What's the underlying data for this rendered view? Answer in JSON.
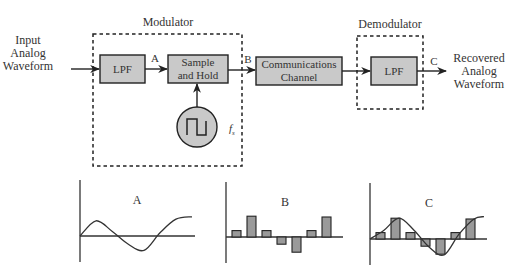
{
  "diagram": {
    "input_label": [
      "Input",
      "Analog",
      "Waveform"
    ],
    "output_label": [
      "Recovered",
      "Analog",
      "Waveform"
    ],
    "modulator": {
      "label": "Modulator",
      "lpf_label": "LPF",
      "sample_hold_label": [
        "Sample",
        "and Hold"
      ],
      "clock_label": "f",
      "clock_subscript": "s"
    },
    "channel_label": [
      "Communications",
      "Channel"
    ],
    "demodulator": {
      "label": "Demodulator",
      "lpf_label": "LPF"
    },
    "points": {
      "a": "A",
      "b": "B",
      "c": "C"
    }
  },
  "waveforms": [
    {
      "id": "A",
      "label": "A",
      "type": "analog",
      "description": "Band-limited analog signal after LPF",
      "samples": [
        0,
        0.95,
        0.3,
        -0.5,
        -0.9,
        0.2,
        1.05,
        1.2
      ]
    },
    {
      "id": "B",
      "label": "B",
      "type": "pam-pulses",
      "description": "Sampled (PAM) pulses",
      "pulse_values": [
        0.4,
        1.3,
        0.4,
        -0.45,
        -0.95,
        0.4,
        1.25
      ]
    },
    {
      "id": "C",
      "label": "C",
      "type": "reconstructed",
      "description": "PAM pulses with reconstructed analog waveform overlay",
      "pulse_values": [
        0.4,
        1.3,
        0.4,
        -0.45,
        -0.95,
        0.4,
        1.25
      ]
    }
  ]
}
